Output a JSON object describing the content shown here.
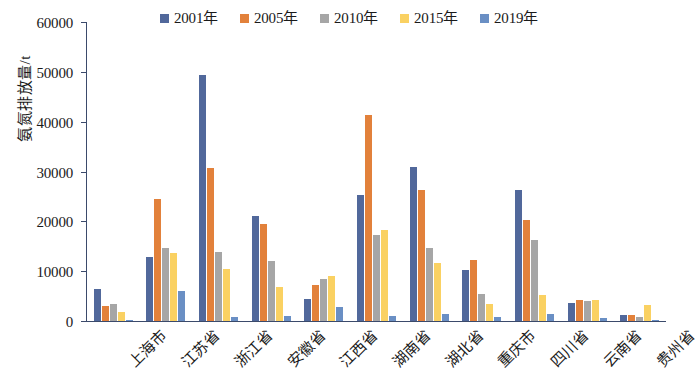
{
  "chart_data": {
    "type": "bar",
    "title": "",
    "subtitle": "",
    "xlabel": "",
    "ylabel": "氨氮排放量/t",
    "ylim": [
      0,
      60000
    ],
    "ytick_labels": [
      "60000",
      "50000",
      "40000",
      "30000",
      "20000",
      "10000",
      "0"
    ],
    "ytick_values": [
      60000,
      50000,
      40000,
      30000,
      20000,
      10000,
      0
    ],
    "grid": false,
    "legend_position": "top",
    "categories": [
      "上海市",
      "江苏省",
      "浙江省",
      "安徽省",
      "江西省",
      "湖南省",
      "湖北省",
      "重庆市",
      "四川省",
      "云南省",
      "贵州省"
    ],
    "series": [
      {
        "name": "2001年",
        "color": "#51689b",
        "values": [
          6500,
          12900,
          49400,
          21000,
          4500,
          25300,
          31000,
          10300,
          26200,
          3600,
          1200
        ]
      },
      {
        "name": "2005年",
        "color": "#e2813b",
        "values": [
          3000,
          24400,
          30700,
          19400,
          7300,
          41400,
          26200,
          12200,
          20200,
          4200,
          1300
        ]
      },
      {
        "name": "2010年",
        "color": "#a6a6a6",
        "values": [
          3400,
          14700,
          13900,
          12000,
          8500,
          17300,
          14700,
          5500,
          16200,
          4000,
          900
        ]
      },
      {
        "name": "2015年",
        "color": "#fad162",
        "values": [
          1900,
          13700,
          10500,
          6900,
          9100,
          18300,
          11700,
          3500,
          5200,
          4200,
          3300
        ]
      },
      {
        "name": "2019年",
        "color": "#6a8fc4",
        "values": [
          300,
          6000,
          900,
          1000,
          2900,
          1000,
          1400,
          900,
          1500,
          700,
          300
        ]
      }
    ]
  },
  "legend": {
    "items": [
      {
        "label": "2001年",
        "color": "#51689b"
      },
      {
        "label": "2005年",
        "color": "#e2813b"
      },
      {
        "label": "2010年",
        "color": "#a6a6a6"
      },
      {
        "label": "2015年",
        "color": "#fad162"
      },
      {
        "label": "2019年",
        "color": "#6a8fc4"
      }
    ]
  },
  "axis": {
    "y_title": "氨氮排放量/t",
    "axis_color": "#3b4a6b"
  }
}
